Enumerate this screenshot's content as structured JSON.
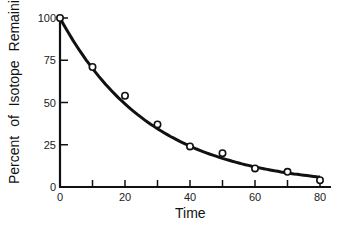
{
  "chart_data": {
    "type": "scatter",
    "title": "",
    "xlabel": "Time",
    "ylabel": "Percent   of   Isotope   Remaining",
    "xlim": [
      0,
      80
    ],
    "ylim": [
      0,
      100
    ],
    "x_ticks": [
      0,
      10,
      20,
      30,
      40,
      50,
      60,
      70,
      80
    ],
    "x_tick_labels": [
      "0",
      "20",
      "40",
      "60",
      "80"
    ],
    "y_ticks": [
      0,
      25,
      50,
      75,
      100
    ],
    "y_tick_labels": [
      "0",
      "25",
      "50",
      "75",
      "100"
    ],
    "grid": false,
    "legend": null,
    "series": [
      {
        "name": "Measured",
        "style": "open-circle-markers",
        "x": [
          0,
          10,
          20,
          30,
          40,
          50,
          60,
          70,
          80
        ],
        "y": [
          100,
          71,
          54,
          37,
          24,
          20,
          11,
          9,
          4
        ]
      },
      {
        "name": "Fitted decay curve",
        "style": "smooth-line",
        "x": [
          0,
          10,
          20,
          30,
          40,
          50,
          60,
          70,
          80
        ],
        "y": [
          100,
          70,
          51,
          37,
          27,
          19,
          13,
          9,
          6
        ]
      }
    ]
  }
}
